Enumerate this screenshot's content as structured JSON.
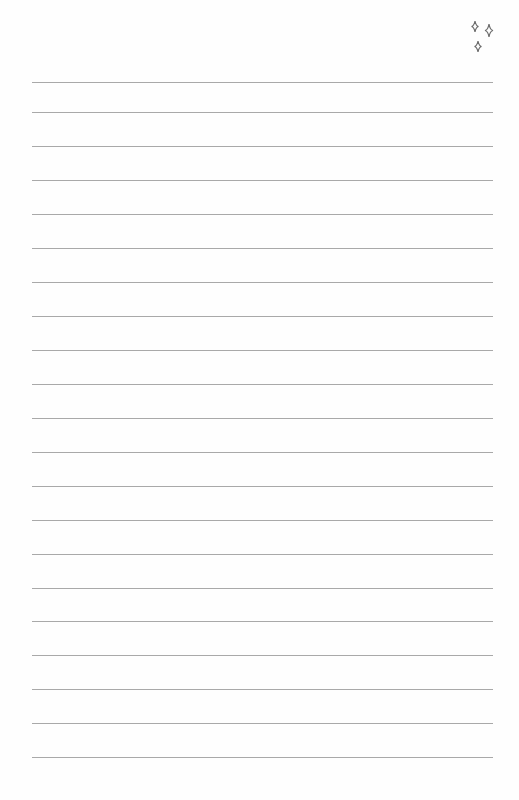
{
  "page": {
    "type": "lined-notebook-page",
    "background": "#fefefe",
    "line_color": "#a9a9a9",
    "line_count": 21,
    "line_left": 32,
    "line_width": 461,
    "line_positions": [
      82,
      112,
      146,
      180,
      214,
      248,
      282,
      316,
      350,
      384,
      418,
      452,
      486,
      520,
      554,
      588,
      621,
      655,
      689,
      723,
      757
    ]
  },
  "decoration": {
    "icon": "sparkles-icon",
    "color": "#6b6b6b"
  }
}
